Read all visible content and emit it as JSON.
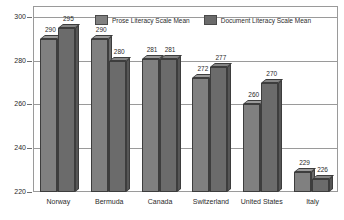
{
  "chart_data": {
    "type": "bar",
    "title": "",
    "subtitle": "",
    "xlabel": "",
    "ylabel": "",
    "categories": [
      "Norway",
      "Bermuda",
      "Canada",
      "Switzerland",
      "United States",
      "Italy"
    ],
    "series": [
      {
        "name": "Prose Literacy Scale Mean",
        "color": "#808080",
        "values": [
          290,
          290,
          281,
          272,
          260,
          229
        ]
      },
      {
        "name": "Document Literacy Scale Mean",
        "color": "#6b6b6b",
        "values": [
          295,
          280,
          281,
          277,
          270,
          226
        ]
      }
    ],
    "ylim": [
      220,
      305
    ],
    "yticks": [
      300,
      280,
      260,
      240,
      220
    ],
    "ytick_labels": [
      "300",
      "280",
      "260",
      "240",
      "220"
    ],
    "grid": true,
    "legend_position": "top-center",
    "data_labels": true,
    "style": "3d-bar-grayscale"
  },
  "legend": {
    "entries": [
      {
        "label": "Prose Literacy Scale Mean"
      },
      {
        "label": "Document Literacy Scale Mean"
      }
    ]
  }
}
